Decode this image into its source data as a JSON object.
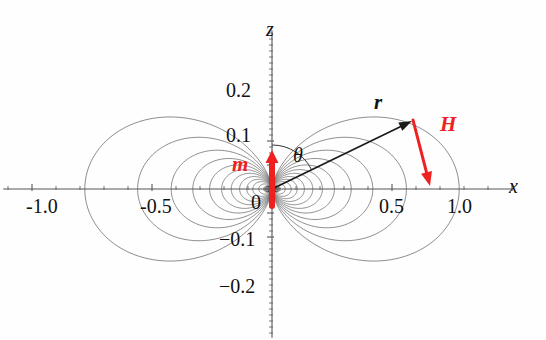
{
  "figure": {
    "background_color": "#fefefe",
    "origin_px": [
      272,
      189
    ],
    "px_per_unit_x": 240,
    "px_per_unit_z": 240
  },
  "axes": {
    "x_axis": {
      "name": "x",
      "tick_labels": [
        "-1.0",
        "-0.5",
        "0.5",
        "1.0"
      ],
      "tick_values": [
        -1.0,
        -0.5,
        0.5,
        1.0
      ],
      "minor_tick_step": 0.1,
      "range": [
        -1.12,
        1.0
      ],
      "label_color": "#111111"
    },
    "z_axis": {
      "name": "z",
      "tick_labels": [
        "0.2",
        "0.1",
        "0",
        "-0.1",
        "-0.2"
      ],
      "tick_labels_unicode": [
        "0.2",
        "0.1",
        "0",
        "−0.1",
        "−0.2"
      ],
      "tick_values": [
        0.2,
        0.1,
        0.0,
        -0.1,
        -0.2
      ],
      "minor_tick_step": 0.025,
      "range": [
        -0.62,
        0.66
      ],
      "label_color": "#111111"
    },
    "axis_color": "#555555"
  },
  "annotations": {
    "dipole_moment": {
      "label": "m",
      "color": "#ee2020",
      "kind": "arrow-up",
      "label_pos_px": [
        232,
        162
      ],
      "tail_px": [
        272,
        206
      ],
      "tip_px": [
        272,
        150
      ]
    },
    "radius_vector": {
      "label": "r",
      "color": "#1a1a1a",
      "kind": "arrow",
      "label_pos_px": [
        374,
        100
      ],
      "tail_px": [
        272,
        189
      ],
      "tip_px": [
        412,
        121
      ]
    },
    "field_vector": {
      "label": "H",
      "color": "#ee2020",
      "kind": "arrow",
      "label_pos_px": [
        440,
        123
      ],
      "tail_px": [
        413,
        120
      ],
      "tip_px": [
        430,
        186
      ]
    },
    "angle": {
      "label": "θ",
      "color": "#111111",
      "label_pos_px": [
        295,
        150
      ],
      "arc_radius_px": 44,
      "from_deg": 90,
      "to_deg": 26
    }
  },
  "chart_data": {
    "type": "line",
    "xlabel": "x",
    "ylabel": "z",
    "xlim": [
      -1.12,
      1.0
    ],
    "ylim": [
      -0.62,
      0.66
    ],
    "grid": false,
    "legend": null,
    "field_line_color": "#5a5a5a",
    "field_line_width": 0.7,
    "loop_scale_R": [
      0.035,
      0.055,
      0.08,
      0.105,
      0.135,
      0.17,
      0.21,
      0.26,
      0.33,
      0.42,
      0.56,
      0.78
    ],
    "loop_count_per_side": 12,
    "sides": [
      "+x",
      "-x"
    ]
  }
}
